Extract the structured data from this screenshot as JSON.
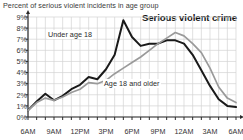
{
  "caption": "Percent of serious violent incidents in age group",
  "title": "Serious violent crime",
  "series_labels": {
    "under18": "Under age 18",
    "adult": "Age 18 and older"
  },
  "colors": {
    "under18": "#1a1a1a",
    "adult": "#9a9a9a",
    "grid": "#d2d2d2",
    "axis": "#2b2b2b",
    "text": "#333333"
  },
  "chart_data": {
    "type": "line",
    "title": "Serious violent crime",
    "subtitle": "Percent of serious violent incidents in age group",
    "xlabel": "",
    "ylabel": "Percent of serious violent incidents in age group",
    "grid": true,
    "legend": "inline-labels",
    "ylim": [
      0,
      9
    ],
    "ytick_labels": [
      "0%",
      "1%",
      "2%",
      "3%",
      "4%",
      "5%",
      "6%",
      "7%",
      "8%",
      "9%"
    ],
    "ytick_values": [
      0,
      1,
      2,
      3,
      4,
      5,
      6,
      7,
      8,
      9
    ],
    "x": [
      "6AM",
      "7AM",
      "8AM",
      "9AM",
      "10AM",
      "11AM",
      "12PM",
      "1PM",
      "2PM",
      "3PM",
      "4PM",
      "5PM",
      "6PM",
      "7PM",
      "8PM",
      "9PM",
      "10PM",
      "11PM",
      "12AM",
      "1AM",
      "2AM",
      "3AM",
      "4AM",
      "5AM",
      "6AM"
    ],
    "xtick_labels": [
      "6AM",
      "9AM",
      "12PM",
      "3PM",
      "6PM",
      "9PM",
      "12AM",
      "3AM",
      "6AM"
    ],
    "xtick_indices": [
      0,
      3,
      6,
      9,
      12,
      15,
      18,
      21,
      24
    ],
    "series": [
      {
        "name": "Under age 18",
        "color": "#1a1a1a",
        "values": [
          0.6,
          1.4,
          2.1,
          1.5,
          1.9,
          2.5,
          2.9,
          3.6,
          3.4,
          4.3,
          5.6,
          8.7,
          7.2,
          6.4,
          6.6,
          6.6,
          6.9,
          6.9,
          6.6,
          5.6,
          4.2,
          2.8,
          1.6,
          1.0,
          0.9
        ]
      },
      {
        "name": "Age 18 and older",
        "color": "#9a9a9a",
        "values": [
          0.6,
          1.3,
          1.7,
          1.5,
          1.8,
          2.2,
          2.5,
          3.1,
          3.0,
          3.3,
          3.9,
          4.4,
          4.9,
          5.4,
          6.0,
          6.6,
          7.1,
          7.6,
          7.3,
          6.6,
          5.8,
          4.4,
          2.7,
          1.7,
          1.3
        ]
      }
    ]
  }
}
